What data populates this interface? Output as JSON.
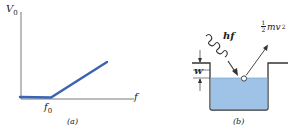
{
  "panel_a": {
    "y_axis_label": "V",
    "y_axis_sub": "0",
    "x_axis_label": "f",
    "threshold_label": "f",
    "threshold_sub": "0",
    "caption": "(a)",
    "line_color": "#3a63b0"
  },
  "panel_b": {
    "photon_label": "hf",
    "energy_label_num": "1",
    "energy_label_den": "2",
    "energy_label_rest": "mv",
    "energy_label_sup": "2",
    "work_function_label": "W",
    "caption": "(b)",
    "fill_color": "#9fc3e6"
  }
}
